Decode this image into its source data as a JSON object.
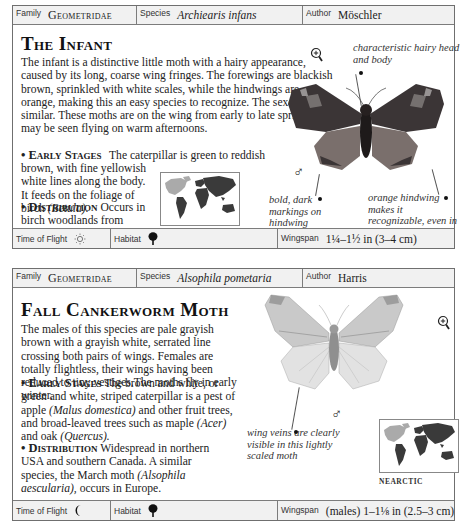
{
  "entries": [
    {
      "header": {
        "family_label": "Family",
        "family": "Geometridae",
        "species_label": "Species",
        "species": "Archiearis infans",
        "author_label": "Author",
        "author": "Möschler"
      },
      "title": "The Infant",
      "description": "The infant is a distinctive little moth with a hairy appearance, caused by its long, coarse wing fringes. The forewings are blackish brown, sprinkled with white scales, while the hindwings are orange, making this an easy species to recognize. The sexes are similar. These moths are on the wing from early to late spring and may be seen flying on warm afternoons.",
      "early_stages_label": "• Early Stages",
      "early_stages_1": "The caterpillar is green to reddish brown, with fine yellowish white lines along the body. It feeds on the foliage of birch",
      "early_stages_latin": "(Betula).",
      "distribution_label": "• Distribution",
      "distribution": "Occurs in birch woodlands from Canada to northern USA.",
      "map_label": "NEARCTIC",
      "sex_symbol": "♂",
      "captions": {
        "head": "characteristic hairy head and body",
        "markings": "bold, dark markings on hindwing",
        "hindwing": "orange hindwing makes it recognizable, even in flight"
      },
      "footer": {
        "time_of_flight_label": "Time of Flight",
        "time_of_flight_icon": "sun-icon",
        "habitat_label": "Habitat",
        "habitat_icon": "deciduous-tree-icon",
        "wingspan_label": "Wingspan",
        "wingspan": "1¼–1½ in (3–4 cm)"
      }
    },
    {
      "header": {
        "family_label": "Family",
        "family": "Geometridae",
        "species_label": "Species",
        "species": "Alsophila pometaria",
        "author_label": "Author",
        "author": "Harris"
      },
      "title": "Fall Cankerworm Moth",
      "description": "The males of this species are pale grayish brown with a grayish white, serrated line crossing both pairs of wings. Females are totally flightless, their wings having been reduced to tiny vestiges.The moths fly in early winter.",
      "early_stages_label": "• Early Stages",
      "early_stages_1": "The brown and white, or green and white, striped caterpillar is a pest of apple",
      "early_stages_latin_1": "(Malus domestica)",
      "early_stages_2": "and other fruit trees, and broad-leaved trees such as maple",
      "early_stages_latin_2": "(Acer)",
      "early_stages_3": "and oak",
      "early_stages_latin_3": "(Quercus).",
      "distribution_label": "• Distribution",
      "distribution": "Widespread in northern USA and southern Canada. A similar species, the March moth",
      "distribution_latin": "(Alsophila aescularia),",
      "distribution_end": "occurs in Europe.",
      "map_label": "NEARCTIC",
      "sex_symbol": "♂",
      "captions": {
        "veins": "wing veins are clearly visible in this lightly scaled moth"
      },
      "footer": {
        "time_of_flight_label": "Time of Flight",
        "time_of_flight_icon": "moon-icon",
        "habitat_label": "Habitat",
        "habitat_icon": "deciduous-tree-icon",
        "wingspan_label": "Wingspan",
        "wingspan": "(males) 1–1⅛ in (2.5–3 cm)"
      }
    }
  ],
  "colors": {
    "border": "#6f6f6f",
    "header_bg": "#f1f1f1",
    "map_region_highlight": "#aaaaaa",
    "map_region_dark": "#3a3a3a",
    "infant_forewing": "#3b3536",
    "infant_hindwing": "#7a6f6c",
    "cankerworm_wing": "#c9c9c9"
  }
}
